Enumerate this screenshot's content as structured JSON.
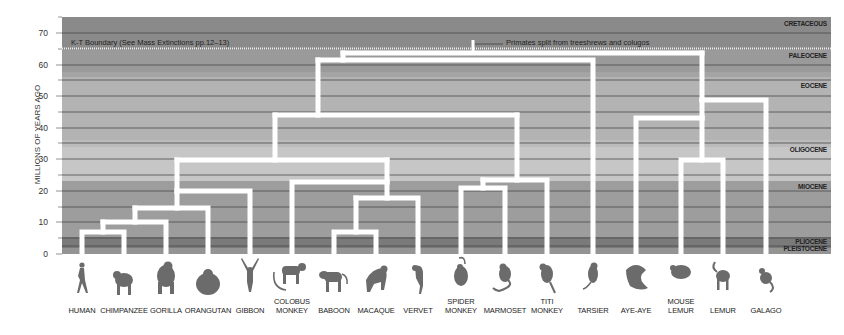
{
  "chart_data": {
    "type": "dendrogram",
    "title": "",
    "ylabel": "MILLIONS OF YEARS AGO",
    "ylim": [
      0,
      74
    ],
    "yticks": [
      0,
      10,
      20,
      30,
      40,
      50,
      60,
      70
    ],
    "epochs": [
      {
        "name": "CRETACEOUS",
        "from": 74,
        "to": 65,
        "color": "#8a8a8a"
      },
      {
        "name": "PALEOCENE",
        "from": 65,
        "to": 56,
        "color": "#9a9a9a"
      },
      {
        "name": "EOCENE",
        "from": 56,
        "to": 34,
        "color": "#b3b3b3"
      },
      {
        "name": "OLIGOCENE",
        "from": 34,
        "to": 23,
        "color": "#c6c6c6"
      },
      {
        "name": "MIOCENE",
        "from": 23,
        "to": 5.3,
        "color": "#9d9d9d"
      },
      {
        "name": "PLIOCENE",
        "from": 5.3,
        "to": 1.8,
        "color": "#7a7a7a"
      },
      {
        "name": "PLEISTOCENE",
        "from": 1.8,
        "to": 0,
        "color": "#949494"
      }
    ],
    "annotations": [
      {
        "text": "K-T Boundary (See Mass Extinctions pp.12–13)",
        "y": 65
      },
      {
        "text": "Primates split from treeshrews and colugos",
        "y": 67
      }
    ],
    "leaves": [
      "HUMAN",
      "CHIMPANZEE",
      "GORILLA",
      "ORANGUTAN",
      "GIBBON",
      "COLOBUS MONKEY",
      "BABOON",
      "MACAQUE",
      "VERVET",
      "SPIDER MONKEY",
      "MARMOSET",
      "TITI MONKEY",
      "TARSIER",
      "AYE-AYE",
      "MOUSE LEMUR",
      "LEMUR",
      "GALAGO"
    ],
    "splits_mya": [
      {
        "clade": "Human–Chimpanzee",
        "mya": 7
      },
      {
        "clade": "+Gorilla",
        "mya": 10
      },
      {
        "clade": "+Orangutan",
        "mya": 15
      },
      {
        "clade": "+Gibbon",
        "mya": 20
      },
      {
        "clade": "Baboon–Macaque",
        "mya": 7
      },
      {
        "clade": "+Vervet",
        "mya": 18
      },
      {
        "clade": "+Colobus",
        "mya": 23
      },
      {
        "clade": "Apes–Old World monkeys",
        "mya": 30
      },
      {
        "clade": "Spider monkey–Marmoset",
        "mya": 20
      },
      {
        "clade": "+Titi",
        "mya": 23
      },
      {
        "clade": "Old World–New World",
        "mya": 44
      },
      {
        "clade": "Anthropoids–Tarsier",
        "mya": 61
      },
      {
        "clade": "Mouse lemur–Lemur",
        "mya": 30
      },
      {
        "clade": "+Aye-aye",
        "mya": 43
      },
      {
        "clade": "+Galago",
        "mya": 48
      },
      {
        "clade": "Primates root",
        "mya": 63
      }
    ]
  },
  "axis": {
    "label": "MILLIONS OF YEARS AGO",
    "ticks": [
      "0",
      "10",
      "20",
      "30",
      "40",
      "50",
      "60",
      "70"
    ]
  },
  "epochs": [
    "CRETACEOUS",
    "PALEOCENE",
    "EOCENE",
    "OLIGOCENE",
    "MIOCENE",
    "PLIOCENE",
    "PLEISTOCENE"
  ],
  "annotations": {
    "kt": "K-T Boundary (See Mass Extinctions pp.12–13)",
    "split": "Primates split from treeshrews and colugos"
  },
  "species": [
    {
      "l1": "",
      "l2": "HUMAN",
      "icon": "human-icon"
    },
    {
      "l1": "",
      "l2": "CHIMPANZEE",
      "icon": "chimpanzee-icon"
    },
    {
      "l1": "",
      "l2": "GORILLA",
      "icon": "gorilla-icon"
    },
    {
      "l1": "",
      "l2": "ORANGUTAN",
      "icon": "orangutan-icon"
    },
    {
      "l1": "",
      "l2": "GIBBON",
      "icon": "gibbon-icon"
    },
    {
      "l1": "COLOBUS",
      "l2": "MONKEY",
      "icon": "colobus-icon"
    },
    {
      "l1": "",
      "l2": "BABOON",
      "icon": "baboon-icon"
    },
    {
      "l1": "",
      "l2": "MACAQUE",
      "icon": "macaque-icon"
    },
    {
      "l1": "",
      "l2": "VERVET",
      "icon": "vervet-icon"
    },
    {
      "l1": "SPIDER",
      "l2": "MONKEY",
      "icon": "spider-monkey-icon"
    },
    {
      "l1": "",
      "l2": "MARMOSET",
      "icon": "marmoset-icon"
    },
    {
      "l1": "TITI",
      "l2": "MONKEY",
      "icon": "titi-icon"
    },
    {
      "l1": "",
      "l2": "TARSIER",
      "icon": "tarsier-icon"
    },
    {
      "l1": "",
      "l2": "AYE-AYE",
      "icon": "aye-aye-icon"
    },
    {
      "l1": "MOUSE",
      "l2": "LEMUR",
      "icon": "mouse-lemur-icon"
    },
    {
      "l1": "",
      "l2": "LEMUR",
      "icon": "lemur-icon"
    },
    {
      "l1": "",
      "l2": "GALAGO",
      "icon": "galago-icon"
    }
  ]
}
